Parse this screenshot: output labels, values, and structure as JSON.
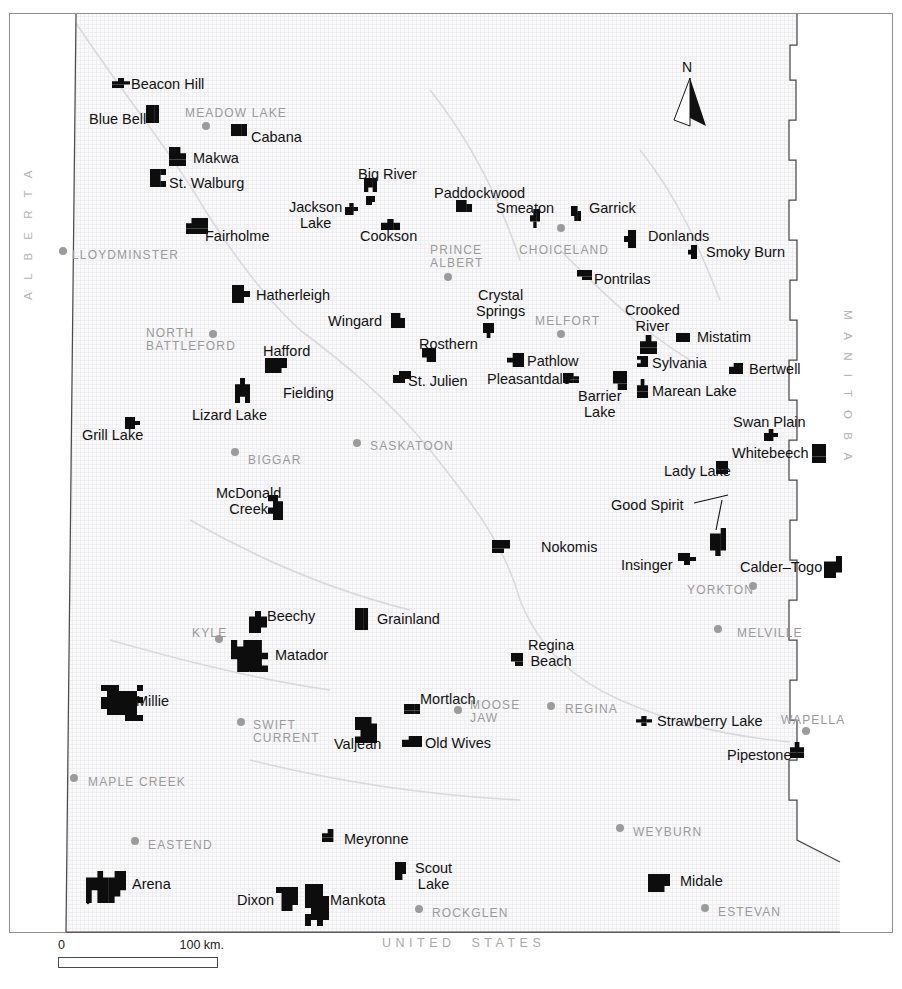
{
  "map": {
    "title": "Saskatchewan Community Pastures",
    "background_color": "#f7f7f8",
    "reserve_color": "#0d0d0d",
    "city_color": "#9a9a9a",
    "community_color": "#111111",
    "border_color": "#4a4a4a"
  },
  "north_arrow": {
    "label": "N"
  },
  "scale_bar": {
    "min": "0",
    "max": "100 km."
  },
  "province_labels": {
    "west": "A L B E R T A",
    "east": "M A N I T O B A",
    "south": "UNITED  STATES"
  },
  "cities": [
    {
      "name": "MEADOW LAKE",
      "x": 185,
      "y": 107,
      "dot_x": 206,
      "dot_y": 126
    },
    {
      "name": "LLOYDMINSTER",
      "x": 72,
      "y": 249,
      "dot_x": 63,
      "dot_y": 251
    },
    {
      "name": "PRINCE\nALBERT",
      "x": 430,
      "y": 244,
      "dot_x": 448,
      "dot_y": 277
    },
    {
      "name": "CHOICELAND",
      "x": 519,
      "y": 244,
      "dot_x": 561,
      "dot_y": 228
    },
    {
      "name": "NORTH\nBATTLEFORD",
      "x": 146,
      "y": 327,
      "dot_x": 213,
      "dot_y": 334
    },
    {
      "name": "MELFORT",
      "x": 535,
      "y": 315,
      "dot_x": 561,
      "dot_y": 334
    },
    {
      "name": "SASKATOON",
      "x": 370,
      "y": 440,
      "dot_x": 357,
      "dot_y": 443
    },
    {
      "name": "BIGGAR",
      "x": 248,
      "y": 454,
      "dot_x": 235,
      "dot_y": 452
    },
    {
      "name": "YORKTON",
      "x": 687,
      "y": 584,
      "dot_x": 753,
      "dot_y": 586
    },
    {
      "name": "MELVILLE",
      "x": 737,
      "y": 627,
      "dot_x": 718,
      "dot_y": 629
    },
    {
      "name": "KYLE",
      "x": 192,
      "y": 627,
      "dot_x": 219,
      "dot_y": 639
    },
    {
      "name": "SWIFT\nCURRENT",
      "x": 253,
      "y": 719,
      "dot_x": 241,
      "dot_y": 722
    },
    {
      "name": "MOOSE\nJAW",
      "x": 470,
      "y": 699,
      "dot_x": 458,
      "dot_y": 710
    },
    {
      "name": "REGINA",
      "x": 565,
      "y": 703,
      "dot_x": 551,
      "dot_y": 706
    },
    {
      "name": "WAPELLA",
      "x": 781,
      "y": 714,
      "dot_x": 806,
      "dot_y": 731
    },
    {
      "name": "MAPLE CREEK",
      "x": 88,
      "y": 776,
      "dot_x": 74,
      "dot_y": 778
    },
    {
      "name": "EASTEND",
      "x": 148,
      "y": 839,
      "dot_x": 135,
      "dot_y": 841
    },
    {
      "name": "WEYBURN",
      "x": 633,
      "y": 826,
      "dot_x": 620,
      "dot_y": 828
    },
    {
      "name": "ROCKGLEN",
      "x": 432,
      "y": 907,
      "dot_x": 419,
      "dot_y": 909
    },
    {
      "name": "ESTEVAN",
      "x": 718,
      "y": 906,
      "dot_x": 705,
      "dot_y": 908
    }
  ],
  "communities": [
    {
      "name": "Beacon Hill",
      "x": 131,
      "y": 77
    },
    {
      "name": "Blue Bell",
      "x": 89,
      "y": 112
    },
    {
      "name": "Cabana",
      "x": 251,
      "y": 130
    },
    {
      "name": "Makwa",
      "x": 193,
      "y": 151
    },
    {
      "name": "St. Walburg",
      "x": 169,
      "y": 176
    },
    {
      "name": "Big River",
      "x": 358,
      "y": 167
    },
    {
      "name": "Paddockwood",
      "x": 434,
      "y": 186
    },
    {
      "name": "Smeaton",
      "x": 496,
      "y": 201
    },
    {
      "name": "Garrick",
      "x": 589,
      "y": 201
    },
    {
      "name": "Jackson\nLake",
      "x": 289,
      "y": 200
    },
    {
      "name": "Cookson",
      "x": 360,
      "y": 229
    },
    {
      "name": "Fairholme",
      "x": 205,
      "y": 229
    },
    {
      "name": "Donlands",
      "x": 648,
      "y": 229
    },
    {
      "name": "Smoky Burn",
      "x": 706,
      "y": 245
    },
    {
      "name": "Pontrilas",
      "x": 594,
      "y": 272
    },
    {
      "name": "Hatherleigh",
      "x": 256,
      "y": 288
    },
    {
      "name": "Wingard",
      "x": 328,
      "y": 314
    },
    {
      "name": "Crystal\nSprings",
      "x": 476,
      "y": 288
    },
    {
      "name": "Crooked\nRiver",
      "x": 625,
      "y": 303
    },
    {
      "name": "Mistatim",
      "x": 697,
      "y": 330
    },
    {
      "name": "Hafford",
      "x": 263,
      "y": 344
    },
    {
      "name": "Rosthern",
      "x": 419,
      "y": 337
    },
    {
      "name": "Pathlow",
      "x": 527,
      "y": 354
    },
    {
      "name": "Sylvania",
      "x": 652,
      "y": 356
    },
    {
      "name": "Bertwell",
      "x": 749,
      "y": 362
    },
    {
      "name": "Fielding",
      "x": 283,
      "y": 386
    },
    {
      "name": "St. Julien",
      "x": 408,
      "y": 374
    },
    {
      "name": "Pleasantdale",
      "x": 487,
      "y": 372
    },
    {
      "name": "Marean Lake",
      "x": 652,
      "y": 384
    },
    {
      "name": "Barrier\nLake",
      "x": 578,
      "y": 389
    },
    {
      "name": "Lizard Lake",
      "x": 192,
      "y": 408
    },
    {
      "name": "Swan Plain",
      "x": 733,
      "y": 415
    },
    {
      "name": "Grill Lake",
      "x": 82,
      "y": 428
    },
    {
      "name": "Whitebeech",
      "x": 732,
      "y": 446
    },
    {
      "name": "Lady Lake",
      "x": 664,
      "y": 464
    },
    {
      "name": "McDonald\nCreek",
      "x": 216,
      "y": 486
    },
    {
      "name": "Good Spirit",
      "x": 611,
      "y": 498
    },
    {
      "name": "Nokomis",
      "x": 541,
      "y": 540
    },
    {
      "name": "Insinger",
      "x": 621,
      "y": 558
    },
    {
      "name": "Calder–Togo",
      "x": 740,
      "y": 560
    },
    {
      "name": "Beechy",
      "x": 267,
      "y": 609
    },
    {
      "name": "Grainland",
      "x": 377,
      "y": 612
    },
    {
      "name": "Matador",
      "x": 275,
      "y": 648
    },
    {
      "name": "Regina\nBeach",
      "x": 528,
      "y": 638
    },
    {
      "name": "Millie",
      "x": 136,
      "y": 694
    },
    {
      "name": "Mortlach",
      "x": 420,
      "y": 692
    },
    {
      "name": "Strawberry Lake",
      "x": 657,
      "y": 714
    },
    {
      "name": "Valjean",
      "x": 334,
      "y": 737
    },
    {
      "name": "Old Wives",
      "x": 425,
      "y": 736
    },
    {
      "name": "Pipestone",
      "x": 727,
      "y": 748
    },
    {
      "name": "Meyronne",
      "x": 344,
      "y": 832
    },
    {
      "name": "Scout\nLake",
      "x": 415,
      "y": 861
    },
    {
      "name": "Midale",
      "x": 680,
      "y": 874
    },
    {
      "name": "Arena",
      "x": 132,
      "y": 877
    },
    {
      "name": "Dixon",
      "x": 237,
      "y": 893
    },
    {
      "name": "Mankota",
      "x": 330,
      "y": 893
    }
  ],
  "reserves": [
    {
      "name": "beacon-hill",
      "x": 112,
      "y": 78,
      "w": 18,
      "h": 10
    },
    {
      "name": "blue-bell",
      "x": 146,
      "y": 105,
      "w": 13,
      "h": 18
    },
    {
      "name": "cabana",
      "x": 231,
      "y": 124,
      "w": 16,
      "h": 12
    },
    {
      "name": "makwa",
      "x": 169,
      "y": 147,
      "w": 17,
      "h": 19
    },
    {
      "name": "st-walburg",
      "x": 150,
      "y": 169,
      "w": 16,
      "h": 18
    },
    {
      "name": "big-river",
      "x": 364,
      "y": 178,
      "w": 13,
      "h": 14
    },
    {
      "name": "big-river-2",
      "x": 366,
      "y": 196,
      "w": 9,
      "h": 9
    },
    {
      "name": "paddockwood",
      "x": 456,
      "y": 200,
      "w": 16,
      "h": 12
    },
    {
      "name": "smeaton",
      "x": 530,
      "y": 209,
      "w": 10,
      "h": 19
    },
    {
      "name": "garrick",
      "x": 571,
      "y": 206,
      "w": 10,
      "h": 15
    },
    {
      "name": "jackson-lake",
      "x": 345,
      "y": 203,
      "w": 13,
      "h": 12
    },
    {
      "name": "cookson",
      "x": 381,
      "y": 219,
      "w": 19,
      "h": 11
    },
    {
      "name": "fairholme",
      "x": 186,
      "y": 218,
      "w": 22,
      "h": 16
    },
    {
      "name": "donlands",
      "x": 624,
      "y": 230,
      "w": 12,
      "h": 18
    },
    {
      "name": "smoky-burn",
      "x": 688,
      "y": 245,
      "w": 9,
      "h": 14
    },
    {
      "name": "pontrilas",
      "x": 577,
      "y": 270,
      "w": 15,
      "h": 10
    },
    {
      "name": "hatherleigh",
      "x": 232,
      "y": 285,
      "w": 18,
      "h": 18
    },
    {
      "name": "wingard",
      "x": 391,
      "y": 313,
      "w": 14,
      "h": 15
    },
    {
      "name": "crystal-springs",
      "x": 483,
      "y": 323,
      "w": 11,
      "h": 15
    },
    {
      "name": "crooked-river",
      "x": 640,
      "y": 335,
      "w": 17,
      "h": 19
    },
    {
      "name": "mistatim",
      "x": 676,
      "y": 333,
      "w": 14,
      "h": 9
    },
    {
      "name": "hafford",
      "x": 265,
      "y": 358,
      "w": 22,
      "h": 15
    },
    {
      "name": "rosthern",
      "x": 422,
      "y": 348,
      "w": 14,
      "h": 14
    },
    {
      "name": "st-julien",
      "x": 393,
      "y": 371,
      "w": 18,
      "h": 12
    },
    {
      "name": "pathlow",
      "x": 507,
      "y": 353,
      "w": 17,
      "h": 14
    },
    {
      "name": "pleasantdale",
      "x": 563,
      "y": 373,
      "w": 16,
      "h": 10
    },
    {
      "name": "sylvania",
      "x": 637,
      "y": 356,
      "w": 11,
      "h": 11
    },
    {
      "name": "bertwell",
      "x": 729,
      "y": 363,
      "w": 14,
      "h": 11
    },
    {
      "name": "barrier-lake",
      "x": 613,
      "y": 371,
      "w": 14,
      "h": 19
    },
    {
      "name": "marean-lake",
      "x": 637,
      "y": 379,
      "w": 11,
      "h": 19
    },
    {
      "name": "lizard-lake",
      "x": 235,
      "y": 378,
      "w": 15,
      "h": 25
    },
    {
      "name": "grill-lake",
      "x": 125,
      "y": 417,
      "w": 15,
      "h": 12
    },
    {
      "name": "swan-plain",
      "x": 764,
      "y": 429,
      "w": 14,
      "h": 12
    },
    {
      "name": "whitebeech",
      "x": 812,
      "y": 444,
      "w": 14,
      "h": 19
    },
    {
      "name": "lady-lake",
      "x": 716,
      "y": 461,
      "w": 12,
      "h": 13
    },
    {
      "name": "mcdonald-creek",
      "x": 268,
      "y": 495,
      "w": 15,
      "h": 25
    },
    {
      "name": "good-spirit",
      "x": 710,
      "y": 528,
      "w": 16,
      "h": 28
    },
    {
      "name": "nokomis",
      "x": 492,
      "y": 540,
      "w": 18,
      "h": 13
    },
    {
      "name": "insinger",
      "x": 678,
      "y": 553,
      "w": 18,
      "h": 12
    },
    {
      "name": "calder-togo",
      "x": 824,
      "y": 556,
      "w": 18,
      "h": 22
    },
    {
      "name": "beechy",
      "x": 249,
      "y": 611,
      "w": 18,
      "h": 22
    },
    {
      "name": "grainland",
      "x": 355,
      "y": 608,
      "w": 13,
      "h": 22
    },
    {
      "name": "matador",
      "x": 231,
      "y": 640,
      "w": 37,
      "h": 32
    },
    {
      "name": "regina-beach",
      "x": 511,
      "y": 653,
      "w": 12,
      "h": 13
    },
    {
      "name": "millie",
      "x": 101,
      "y": 685,
      "w": 42,
      "h": 36
    },
    {
      "name": "mortlach",
      "x": 404,
      "y": 704,
      "w": 16,
      "h": 10
    },
    {
      "name": "strawberry-lake",
      "x": 636,
      "y": 716,
      "w": 16,
      "h": 10
    },
    {
      "name": "valjean",
      "x": 355,
      "y": 717,
      "w": 22,
      "h": 26
    },
    {
      "name": "old-wives",
      "x": 402,
      "y": 736,
      "w": 20,
      "h": 11
    },
    {
      "name": "pipestone",
      "x": 790,
      "y": 742,
      "w": 14,
      "h": 16
    },
    {
      "name": "meyronne",
      "x": 322,
      "y": 829,
      "w": 17,
      "h": 13
    },
    {
      "name": "scout-lake",
      "x": 395,
      "y": 862,
      "w": 11,
      "h": 18
    },
    {
      "name": "midale",
      "x": 648,
      "y": 874,
      "w": 22,
      "h": 18
    },
    {
      "name": "arena",
      "x": 86,
      "y": 871,
      "w": 40,
      "h": 32
    },
    {
      "name": "dixon",
      "x": 276,
      "y": 887,
      "w": 22,
      "h": 24
    },
    {
      "name": "mankota",
      "x": 305,
      "y": 884,
      "w": 24,
      "h": 42
    }
  ]
}
